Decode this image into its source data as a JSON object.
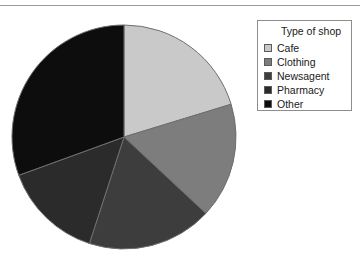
{
  "chart_data": {
    "type": "pie",
    "title": "",
    "legend_title": "Type of shop",
    "legend_position": "right",
    "categories": [
      "Cafe",
      "Clothing",
      "Newsagent",
      "Pharmacy",
      "Other"
    ],
    "values": [
      73,
      60,
      65,
      52,
      110
    ],
    "value_unit": "degrees",
    "percentages": [
      20.3,
      16.7,
      18.1,
      14.4,
      30.6
    ],
    "colors": [
      "#c9c9c9",
      "#7d7d7d",
      "#3d3d3d",
      "#2b2b2b",
      "#0d0d0d"
    ],
    "start_angle_deg": 0,
    "direction": "clockwise",
    "grid": false,
    "xlabel": "",
    "ylabel": ""
  },
  "legend": {
    "title": "Type of shop",
    "items": [
      {
        "label": "Cafe",
        "color": "#c9c9c9"
      },
      {
        "label": "Clothing",
        "color": "#7d7d7d"
      },
      {
        "label": "Newsagent",
        "color": "#3d3d3d"
      },
      {
        "label": "Pharmacy",
        "color": "#2b2b2b"
      },
      {
        "label": "Other",
        "color": "#0d0d0d"
      }
    ]
  },
  "pie": {
    "center_x": 124,
    "center_y": 137,
    "radius": 112,
    "stroke": "#6e6e6e"
  }
}
